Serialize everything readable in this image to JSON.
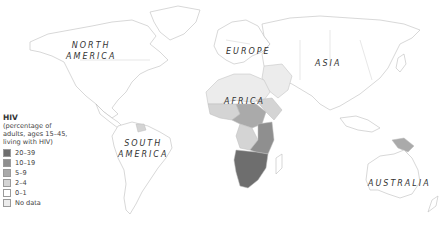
{
  "map": {
    "title": "HIV",
    "subtitle_lines": [
      "(percentage of",
      "adults, ages 15–45,",
      "living with HIV)"
    ],
    "legend": [
      {
        "label": "20–39",
        "color": "#6e6e6e"
      },
      {
        "label": "10–19",
        "color": "#8f8f8f"
      },
      {
        "label": "5–9",
        "color": "#aaaaaa"
      },
      {
        "label": "2–4",
        "color": "#d4d4d4"
      },
      {
        "label": "0–1",
        "color": "#ffffff"
      },
      {
        "label": "No data",
        "color": "#ececec"
      }
    ],
    "regions": {
      "north_america": [
        "NORTH",
        "AMERICA"
      ],
      "south_america": [
        "SOUTH",
        "AMERICA"
      ],
      "europe": "EUROPE",
      "asia": "ASIA",
      "africa": "AFRICA",
      "australia": "AUSTRALIA"
    }
  }
}
